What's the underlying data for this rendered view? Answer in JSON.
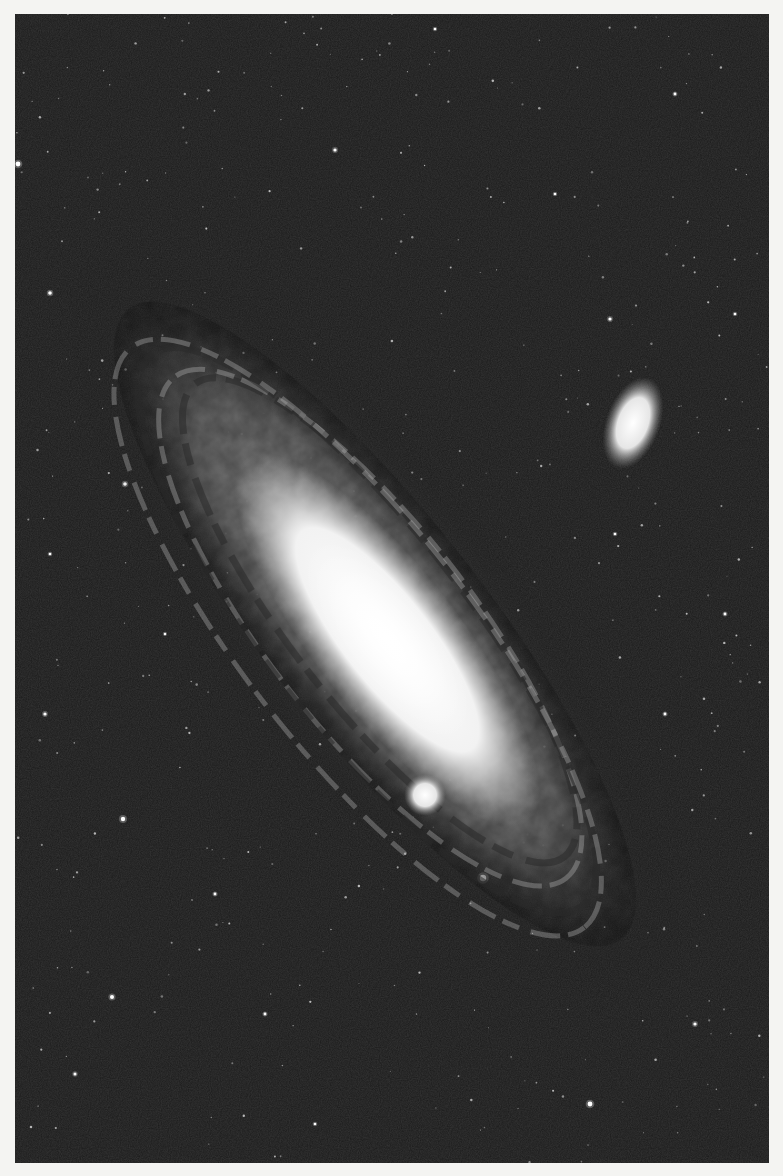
{
  "image": {
    "subject": "spiral galaxy with two companion galaxies",
    "background_color": "#f4f4f2",
    "sky_color": "#1a1a1a",
    "frame": {
      "x": 15,
      "y": 14,
      "width": 754,
      "height": 1149
    }
  },
  "galaxy": {
    "center": [
      360,
      610
    ],
    "rotation_deg": 52,
    "halo": {
      "rx": 470,
      "ry": 150,
      "color": "#5a5a5a"
    },
    "disk": {
      "rx": 400,
      "ry": 110,
      "color": "#8a8a8a"
    },
    "bulge": {
      "rx": 230,
      "ry": 72,
      "color": "#ffffff"
    },
    "core": {
      "rx": 120,
      "ry": 48,
      "color": "#ffffff"
    },
    "dust_lanes": [
      {
        "rx": 300,
        "ry": 88,
        "offset": -6
      },
      {
        "rx": 350,
        "ry": 100,
        "offset": 10
      }
    ]
  },
  "companions": [
    {
      "name": "elliptical-companion",
      "cx": 618,
      "cy": 409,
      "rx": 17,
      "ry": 30,
      "rotation_deg": 20
    },
    {
      "name": "compact-companion",
      "cx": 410,
      "cy": 781,
      "rx": 13,
      "ry": 13,
      "rotation_deg": 0
    }
  ],
  "bright_stars": [
    [
      468,
      864,
      3.2
    ],
    [
      108,
      805,
      2.2
    ],
    [
      97,
      983,
      2
    ],
    [
      575,
      1090,
      2.4
    ],
    [
      3,
      150,
      2.4
    ],
    [
      35,
      279,
      1.8
    ],
    [
      320,
      136,
      1.6
    ],
    [
      595,
      305,
      1.6
    ],
    [
      110,
      470,
      1.8
    ],
    [
      660,
      80,
      1.4
    ],
    [
      710,
      600,
      1.4
    ],
    [
      30,
      700,
      1.6
    ],
    [
      250,
      1000,
      1.4
    ],
    [
      680,
      1010,
      1.6
    ],
    [
      420,
      15,
      1.3
    ],
    [
      540,
      180,
      1.3
    ],
    [
      60,
      1060,
      1.5
    ],
    [
      300,
      1110,
      1.3
    ],
    [
      720,
      300,
      1.3
    ],
    [
      200,
      880,
      1.4
    ],
    [
      600,
      520,
      1.3
    ],
    [
      650,
      700,
      1.4
    ],
    [
      150,
      620,
      1.2
    ],
    [
      35,
      540,
      1.3
    ]
  ]
}
